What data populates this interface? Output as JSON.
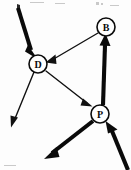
{
  "diagram": {
    "type": "directed-graph",
    "canvas": {
      "width": 131,
      "height": 170,
      "background": "#fdfdfd"
    },
    "ink_color": "#0b0b0b",
    "nodes": [
      {
        "id": "B",
        "label": "B",
        "cx": 106,
        "cy": 27,
        "r": 9
      },
      {
        "id": "D",
        "label": "D",
        "cx": 38,
        "cy": 64,
        "r": 9
      },
      {
        "id": "P",
        "label": "P",
        "cx": 100,
        "cy": 114,
        "r": 9
      }
    ],
    "edges": [
      {
        "id": "b-to-d",
        "from": "B",
        "to": "D",
        "weight": "thin",
        "arrowhead_at": "D"
      },
      {
        "id": "d-to-p",
        "from": "D",
        "to": "P",
        "weight": "thin",
        "arrowhead_at": "P"
      },
      {
        "id": "p-to-b",
        "from": "P",
        "to": "B",
        "weight": "thick",
        "arrowhead_at": "B"
      }
    ],
    "external_arrows": [
      {
        "id": "in-top-left-to-d",
        "direction": "inbound",
        "target": "D",
        "weight": "thick",
        "from_point": [
          17,
          6
        ],
        "to_point": [
          33,
          57
        ]
      },
      {
        "id": "out-d-to-bottom-left",
        "direction": "outbound",
        "source": "D",
        "weight": "thin",
        "from_point": [
          34,
          72
        ],
        "to_point": [
          12,
          126
        ]
      },
      {
        "id": "out-p-to-bottom-left",
        "direction": "outbound",
        "source": "P",
        "weight": "thick",
        "from_point": [
          93,
          121
        ],
        "to_point": [
          45,
          158
        ]
      },
      {
        "id": "in-bottom-right-to-p",
        "direction": "inbound",
        "target": "P",
        "weight": "thick",
        "from_point": [
          128,
          169
        ],
        "to_point": [
          107,
          122
        ]
      }
    ],
    "speckles": [
      {
        "x": 18,
        "y": 5,
        "w": 3,
        "h": 5,
        "tone": "dark"
      },
      {
        "x": 96,
        "y": 2,
        "w": 3,
        "h": 3,
        "tone": "light"
      },
      {
        "x": 101,
        "y": 3,
        "w": 2,
        "h": 2,
        "tone": "light"
      },
      {
        "x": 30,
        "y": 2,
        "w": 14,
        "h": 1,
        "tone": "light"
      },
      {
        "x": 55,
        "y": 3,
        "w": 10,
        "h": 1,
        "tone": "light"
      },
      {
        "x": 110,
        "y": 5,
        "w": 9,
        "h": 1,
        "tone": "light"
      },
      {
        "x": 4,
        "y": 165,
        "w": 12,
        "h": 1,
        "tone": "light"
      }
    ]
  }
}
